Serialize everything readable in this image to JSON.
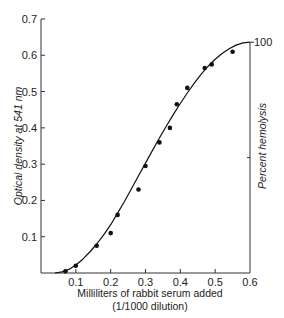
{
  "chart_data": {
    "type": "scatter",
    "title": "",
    "xlabel": "Milliliters of rabbit serum added",
    "xlabel_sub": "(1/1000 dilution)",
    "ylabel": "Optical density at 541 nm",
    "ylabel_right": "Percent hemolysis",
    "right_axis_tick": "100",
    "xlim": [
      0,
      0.6
    ],
    "ylim": [
      0,
      0.7
    ],
    "x_ticks": [
      "0.1",
      "0.2",
      "0.3",
      "0.4",
      "0.5",
      "0.6"
    ],
    "y_ticks": [
      "0.1",
      "0.2",
      "0.3",
      "0.4",
      "0.5",
      "0.6",
      "0.7"
    ],
    "grid": false,
    "legend": null,
    "series": [
      {
        "name": "measured",
        "style": "points",
        "x": [
          0.07,
          0.1,
          0.16,
          0.2,
          0.22,
          0.28,
          0.3,
          0.34,
          0.37,
          0.39,
          0.42,
          0.47,
          0.49,
          0.55
        ],
        "y": [
          0.005,
          0.02,
          0.075,
          0.11,
          0.16,
          0.23,
          0.295,
          0.36,
          0.4,
          0.465,
          0.51,
          0.565,
          0.575,
          0.61
        ]
      },
      {
        "name": "fitted curve",
        "style": "line",
        "x": [
          0.04,
          0.06,
          0.08,
          0.1,
          0.12,
          0.14,
          0.16,
          0.18,
          0.2,
          0.22,
          0.24,
          0.26,
          0.28,
          0.3,
          0.32,
          0.34,
          0.36,
          0.38,
          0.4,
          0.42,
          0.44,
          0.46,
          0.48,
          0.5,
          0.52,
          0.54,
          0.56,
          0.58,
          0.6
        ],
        "y": [
          0.0,
          0.003,
          0.01,
          0.022,
          0.038,
          0.058,
          0.08,
          0.105,
          0.133,
          0.165,
          0.198,
          0.233,
          0.268,
          0.303,
          0.338,
          0.372,
          0.405,
          0.437,
          0.467,
          0.496,
          0.523,
          0.548,
          0.57,
          0.589,
          0.605,
          0.618,
          0.628,
          0.634,
          0.636
        ]
      }
    ]
  }
}
